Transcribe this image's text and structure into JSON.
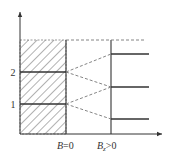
{
  "diagram": {
    "type": "energy-level-splitting",
    "colors": {
      "line": "#333333",
      "dashed": "#777777",
      "hatch": "#555555",
      "background": "#ffffff"
    },
    "axes": {
      "y_arrow": true,
      "x_arrow": true
    },
    "left_levels": [
      {
        "label": "2",
        "y": 72
      },
      {
        "label": "1",
        "y": 104
      }
    ],
    "right_levels_y": [
      54,
      87,
      119
    ],
    "x_labels": {
      "b_zero": {
        "prefix": "B",
        "suffix": "=0"
      },
      "b_positive": {
        "prefix": "B",
        "subscript": "z",
        "suffix": ">0"
      }
    }
  }
}
